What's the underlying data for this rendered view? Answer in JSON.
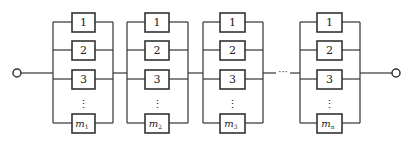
{
  "diagram": {
    "type": "series-parallel reliability block diagram",
    "input_terminal": "input-node",
    "output_terminal": "output-node",
    "between_groups_ellipsis": "···",
    "vertical_ellipsis": "⋮",
    "colors": {
      "line": "#333333",
      "background": "#ffffff",
      "text": "#222222"
    },
    "groups": [
      {
        "name": "group-1",
        "items": [
          "1",
          "2",
          "3"
        ],
        "last": {
          "base": "m",
          "sub": "1"
        }
      },
      {
        "name": "group-2",
        "items": [
          "1",
          "2",
          "3"
        ],
        "last": {
          "base": "m",
          "sub": "2"
        }
      },
      {
        "name": "group-3",
        "items": [
          "1",
          "2",
          "3"
        ],
        "last": {
          "base": "m",
          "sub": "3"
        }
      },
      {
        "name": "group-n",
        "items": [
          "1",
          "2",
          "3"
        ],
        "last": {
          "base": "m",
          "sub": "n"
        }
      }
    ]
  }
}
